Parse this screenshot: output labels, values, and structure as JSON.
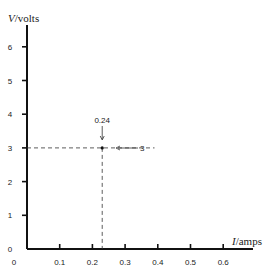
{
  "chart_data": {
    "type": "line",
    "title": "",
    "xlabel_var": "I",
    "xlabel_unit": "/amps",
    "ylabel_var": "V",
    "ylabel_unit": "/volts",
    "x_ticks": [
      "0",
      "0.1",
      "0.2",
      "0.3",
      "0.4",
      "0.5",
      "0.6"
    ],
    "y_ticks": [
      "0",
      "1",
      "2",
      "3",
      "4",
      "5",
      "6"
    ],
    "xlim": [
      0,
      0.65
    ],
    "ylim": [
      0,
      6.5
    ],
    "grid": false,
    "point": {
      "x": 0.23,
      "y": 3
    },
    "annotations": [
      {
        "text": "0.24",
        "target": "x-reading",
        "arrow": "down"
      },
      {
        "text": "3",
        "target": "y-reading",
        "arrow": "left"
      }
    ]
  }
}
